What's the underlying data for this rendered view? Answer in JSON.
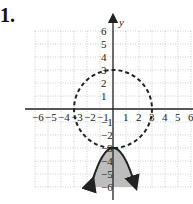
{
  "problem": {
    "number_label": "1."
  },
  "chart_data": {
    "type": "graph",
    "title": "",
    "xlabel": "",
    "ylabel": "y",
    "xlim": [
      -6,
      6
    ],
    "ylim": [
      -6,
      6
    ],
    "grid": true,
    "x_tick_labels": [
      "-6",
      "-5",
      "-4",
      "-3",
      "-2",
      "-1",
      "1",
      "2",
      "3",
      "4",
      "5",
      "6"
    ],
    "y_tick_labels": [
      "6",
      "5",
      "4",
      "3",
      "2",
      "1",
      "-1",
      "-2",
      "-3",
      "-4",
      "-5",
      "-6"
    ],
    "curves": [
      {
        "name": "circle",
        "equation": "x^2 + y^2 = 9",
        "center": [
          0,
          0
        ],
        "radius": 3,
        "style": "dashed",
        "color": "#222222"
      },
      {
        "name": "parabola",
        "equation": "y = -x^2 - 3",
        "vertex": [
          0,
          -3
        ],
        "opens": "down",
        "style": "solid",
        "arrows": true,
        "color": "#222222"
      }
    ],
    "shaded_region": {
      "description": "inside parabola below vertex (y <= -x^2 - 3)",
      "color": "#bdbdbd"
    }
  }
}
